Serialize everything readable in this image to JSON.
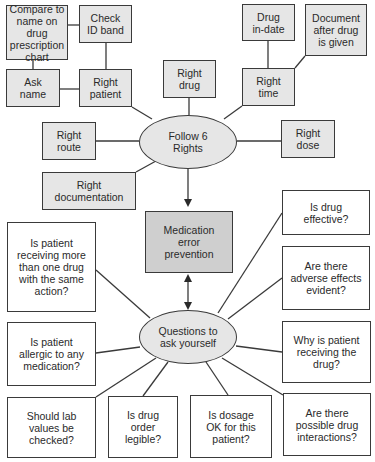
{
  "title": "Medication error prevention",
  "colors": {
    "line": "#3a3a3a",
    "shaded_fill": "#e6e6e6",
    "central_fill": "#cfcfcf",
    "white_fill": "#ffffff",
    "text": "#2a2a2a"
  },
  "central": {
    "label": "Medication\nerror\nprevention"
  },
  "rights": {
    "hub_label": "Follow 6\nRights",
    "right_patient": "Right\npatient",
    "right_drug": "Right\ndrug",
    "right_time": "Right\ntime",
    "right_route": "Right\nroute",
    "right_dose": "Right\ndose",
    "right_documentation": "Right\ndocumentation",
    "patient_details": {
      "compare_name": "Compare to\nname on drug\nprescription\nchart",
      "check_id": "Check\nID band",
      "ask_name": "Ask\nname"
    },
    "time_details": {
      "drug_in_date": "Drug\nin-date",
      "document_after": "Document\nafter drug\nis given"
    }
  },
  "questions": {
    "hub_label": "Questions to\nask yourself",
    "items": [
      "Is drug\neffective?",
      "Is patient\nreceiving more\nthan one drug\nwith the same\naction?",
      "Are there\nadverse effects\nevident?",
      "Is patient\nallergic to any\nmedication?",
      "Why is patient\nreceiving the\ndrug?",
      "Should lab\nvalues be\nchecked?",
      "Is drug\norder\nlegible?",
      "Is dosage\nOK for this\npatient?",
      "Are there\npossible drug\ninteractions?"
    ]
  }
}
